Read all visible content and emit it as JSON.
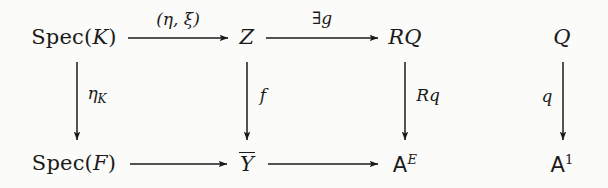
{
  "diagram": {
    "type": "commutative-diagram",
    "background_color": "#fbfbf9",
    "ink_color": "#1a1a1a",
    "nodes": [
      {
        "id": "spec-k",
        "label": "Spec(K)",
        "row": "top",
        "col": 1,
        "x": 74,
        "y": 37
      },
      {
        "id": "z",
        "label": "Z",
        "row": "top",
        "col": 2,
        "x": 247,
        "y": 37
      },
      {
        "id": "rq",
        "label": "RQ",
        "row": "top",
        "col": 3,
        "x": 405,
        "y": 37
      },
      {
        "id": "q",
        "label": "Q",
        "row": "top",
        "col": 4,
        "x": 562,
        "y": 37
      },
      {
        "id": "spec-f",
        "label": "Spec(F)",
        "row": "bottom",
        "col": 1,
        "x": 74,
        "y": 163
      },
      {
        "id": "ybar",
        "label": "Y̅",
        "row": "bottom",
        "col": 2,
        "x": 247,
        "y": 163
      },
      {
        "id": "a-e",
        "label": "𝔸^E",
        "row": "bottom",
        "col": 3,
        "x": 405,
        "y": 163
      },
      {
        "id": "a-1",
        "label": "𝔸^1",
        "row": "bottom",
        "col": 4,
        "x": 562,
        "y": 163
      }
    ],
    "arrows": [
      {
        "id": "top-1",
        "from": "spec-k",
        "to": "z",
        "direction": "right",
        "label": "(η, ξ)",
        "label_side": "above"
      },
      {
        "id": "top-2",
        "from": "z",
        "to": "rq",
        "direction": "right",
        "label": "∃g",
        "label_side": "above"
      },
      {
        "id": "ver-1",
        "from": "spec-k",
        "to": "spec-f",
        "direction": "down",
        "label": "η_K",
        "label_side": "right"
      },
      {
        "id": "ver-2",
        "from": "z",
        "to": "ybar",
        "direction": "down",
        "label": "f",
        "label_side": "right"
      },
      {
        "id": "ver-3",
        "from": "rq",
        "to": "a-e",
        "direction": "down",
        "label": "Rq",
        "label_side": "right"
      },
      {
        "id": "ver-4",
        "from": "q",
        "to": "a-1",
        "direction": "down",
        "label": "q",
        "label_side": "left"
      },
      {
        "id": "bot-1",
        "from": "spec-f",
        "to": "ybar",
        "direction": "right",
        "label": "",
        "label_side": "none"
      },
      {
        "id": "bot-2",
        "from": "ybar",
        "to": "a-e",
        "direction": "right",
        "label": "",
        "label_side": "none"
      }
    ],
    "labels": {
      "node_spec_k_prefix": "Spec(",
      "node_spec_k_arg": "K",
      "node_spec_k_suffix": ")",
      "node_z": "Z",
      "node_rq": "RQ",
      "node_q": "Q",
      "node_spec_f_prefix": "Spec(",
      "node_spec_f_arg": "F",
      "node_spec_f_suffix": ")",
      "node_ybar": "Y",
      "node_a_e_base": "A",
      "node_a_e_sup": "E",
      "node_a_1_base": "A",
      "node_a_1_sup": "1",
      "arrow_top1": "(η, ξ)",
      "arrow_top2_op": "∃",
      "arrow_top2_var": "g",
      "arrow_ver1_base": "η",
      "arrow_ver1_sub": "K",
      "arrow_ver2": "f",
      "arrow_ver3": "Rq",
      "arrow_ver4": "q"
    }
  }
}
